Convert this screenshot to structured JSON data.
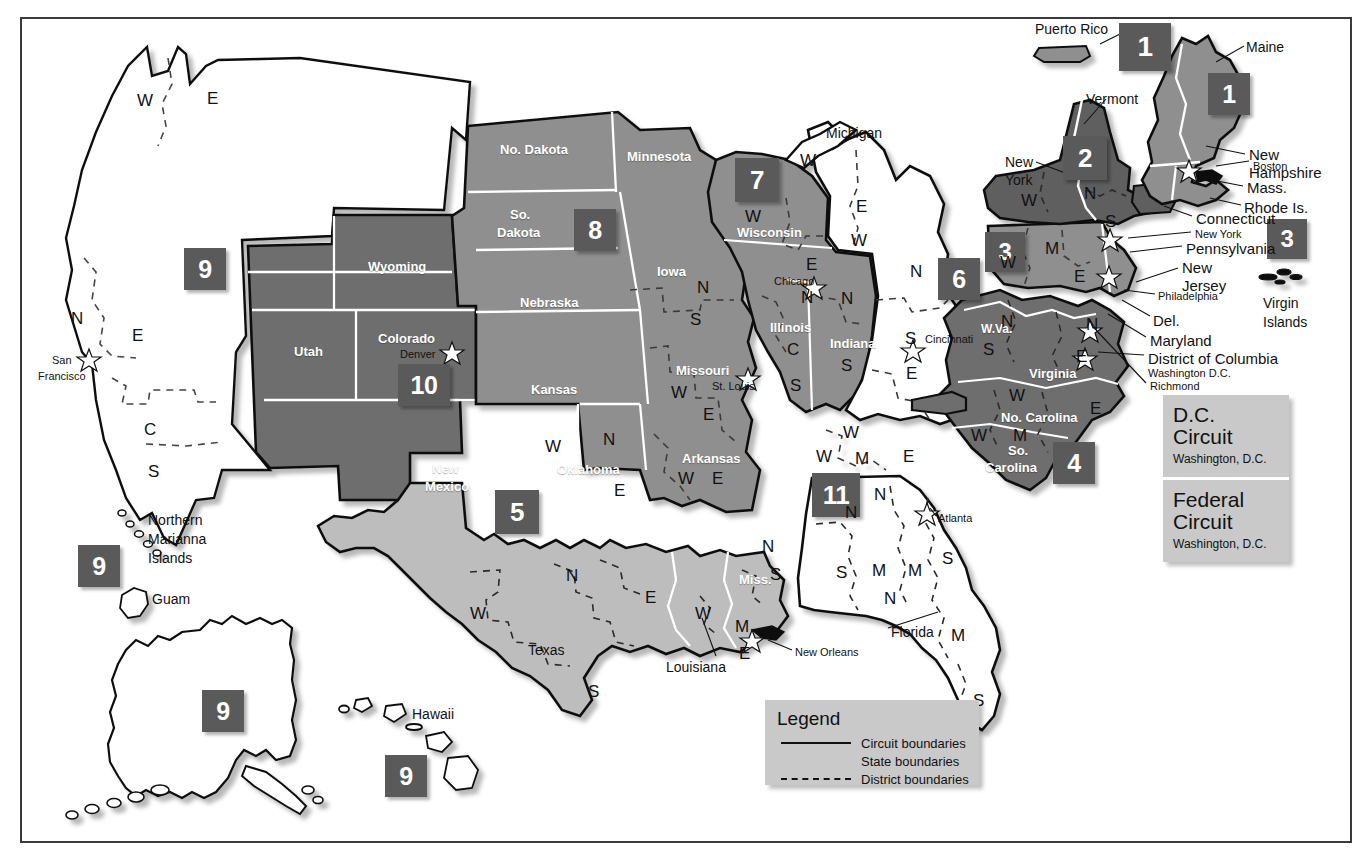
{
  "map": {
    "title": "Geographical Boundaries of United States Courts of Appeals and United States District Courts",
    "colors": {
      "badge_fill": "#5a5a5a",
      "badge_text": "#ffffff",
      "circuit_dark": "#6e6e6e",
      "circuit_mid": "#8f8f8f",
      "circuit_light": "#bdbdbd",
      "circuit_white": "#ffffff",
      "panel_fill": "#c9c9c9",
      "boundary": "#111111",
      "state_line": "#ffffff"
    }
  },
  "badges": [
    {
      "number": "1",
      "name": "badge-circuit-1-puerto-rico",
      "x": 1119,
      "y": 23,
      "w": 52,
      "h": 48,
      "fs": 28
    },
    {
      "number": "1",
      "name": "badge-circuit-1-maine",
      "x": 1208,
      "y": 73,
      "w": 42,
      "h": 42,
      "fs": 25
    },
    {
      "number": "2",
      "name": "badge-circuit-2",
      "x": 1063,
      "y": 136,
      "w": 44,
      "h": 44,
      "fs": 26
    },
    {
      "number": "3",
      "name": "badge-circuit-3",
      "x": 985,
      "y": 232,
      "w": 40,
      "h": 40,
      "fs": 24
    },
    {
      "number": "3",
      "name": "badge-circuit-3-virgin-islands",
      "x": 1267,
      "y": 219,
      "w": 40,
      "h": 40,
      "fs": 24
    },
    {
      "number": "4",
      "name": "badge-circuit-4",
      "x": 1053,
      "y": 442,
      "w": 42,
      "h": 42,
      "fs": 25
    },
    {
      "number": "5",
      "name": "badge-circuit-5",
      "x": 495,
      "y": 490,
      "w": 44,
      "h": 44,
      "fs": 26
    },
    {
      "number": "6",
      "name": "badge-circuit-6",
      "x": 938,
      "y": 258,
      "w": 42,
      "h": 42,
      "fs": 25
    },
    {
      "number": "7",
      "name": "badge-circuit-7",
      "x": 735,
      "y": 158,
      "w": 44,
      "h": 44,
      "fs": 26
    },
    {
      "number": "8",
      "name": "badge-circuit-8",
      "x": 574,
      "y": 209,
      "w": 42,
      "h": 42,
      "fs": 25
    },
    {
      "number": "9",
      "name": "badge-circuit-9-california",
      "x": 184,
      "y": 248,
      "w": 42,
      "h": 42,
      "fs": 25
    },
    {
      "number": "9",
      "name": "badge-circuit-9-marianas",
      "x": 78,
      "y": 545,
      "w": 42,
      "h": 42,
      "fs": 25
    },
    {
      "number": "9",
      "name": "badge-circuit-9-alaska",
      "x": 202,
      "y": 690,
      "w": 42,
      "h": 42,
      "fs": 25
    },
    {
      "number": "9",
      "name": "badge-circuit-9-hawaii",
      "x": 385,
      "y": 755,
      "w": 42,
      "h": 42,
      "fs": 25
    },
    {
      "number": "10",
      "name": "badge-circuit-10",
      "x": 398,
      "y": 364,
      "w": 52,
      "h": 42,
      "fs": 25
    },
    {
      "number": "11",
      "name": "badge-circuit-11",
      "x": 812,
      "y": 473,
      "w": 48,
      "h": 44,
      "fs": 26
    }
  ],
  "panels": [
    {
      "title_line1": "D.C.",
      "title_line2": "Circuit",
      "sub": "Washington, D.C."
    },
    {
      "title_line1": "Federal",
      "title_line2": "Circuit",
      "sub": "Washington, D.C."
    }
  ],
  "legend": {
    "title": "Legend",
    "rows": [
      {
        "key": "solid",
        "label": "Circuit boundaries"
      },
      {
        "key": "state",
        "label": "State boundaries"
      },
      {
        "key": "dashed",
        "label": "District boundaries"
      }
    ]
  },
  "state_labels_light": [
    {
      "text": "No. Dakota",
      "x": 500,
      "y": 143,
      "size": 13
    },
    {
      "text": "Minnesota",
      "x": 627,
      "y": 150,
      "size": 13
    },
    {
      "text": "So.",
      "x": 510,
      "y": 208,
      "size": 13
    },
    {
      "text": "Dakota",
      "x": 497,
      "y": 226,
      "size": 13
    },
    {
      "text": "Nebraska",
      "x": 520,
      "y": 296,
      "size": 13
    },
    {
      "text": "Iowa",
      "x": 657,
      "y": 265,
      "size": 13
    },
    {
      "text": "Kansas",
      "x": 531,
      "y": 383,
      "size": 13
    },
    {
      "text": "Oklahoma",
      "x": 557,
      "y": 463,
      "size": 13
    },
    {
      "text": "Missouri",
      "x": 676,
      "y": 364,
      "size": 13
    },
    {
      "text": "Arkansas",
      "x": 682,
      "y": 452,
      "size": 13
    },
    {
      "text": "Wyoming",
      "x": 368,
      "y": 260,
      "size": 13
    },
    {
      "text": "Utah",
      "x": 294,
      "y": 345,
      "size": 13
    },
    {
      "text": "Colorado",
      "x": 378,
      "y": 332,
      "size": 13
    },
    {
      "text": "New",
      "x": 432,
      "y": 462,
      "size": 13
    },
    {
      "text": "Mexico",
      "x": 425,
      "y": 480,
      "size": 13
    },
    {
      "text": "Wisconsin",
      "x": 737,
      "y": 226,
      "size": 13
    },
    {
      "text": "Illinois",
      "x": 770,
      "y": 321,
      "size": 13
    },
    {
      "text": "Indiana",
      "x": 830,
      "y": 337,
      "size": 13
    },
    {
      "text": "W.Va.",
      "x": 981,
      "y": 323,
      "size": 12
    },
    {
      "text": "Virginia",
      "x": 1029,
      "y": 367,
      "size": 13
    },
    {
      "text": "No. Carolina",
      "x": 1001,
      "y": 411,
      "size": 13
    },
    {
      "text": "So.",
      "x": 1008,
      "y": 444,
      "size": 13
    },
    {
      "text": "Carolina",
      "x": 985,
      "y": 461,
      "size": 13
    },
    {
      "text": "Miss.",
      "x": 739,
      "y": 573,
      "size": 13
    }
  ],
  "state_labels_dark": [
    {
      "text": "Michigan",
      "x": 826,
      "y": 126,
      "size": 14
    },
    {
      "text": "Texas",
      "x": 528,
      "y": 643,
      "size": 14
    },
    {
      "text": "Louisiana",
      "x": 666,
      "y": 660,
      "size": 14
    },
    {
      "text": "Florida",
      "x": 891,
      "y": 625,
      "size": 14
    },
    {
      "text": "Hawaii",
      "x": 412,
      "y": 707,
      "size": 14
    },
    {
      "text": "Guam",
      "x": 152,
      "y": 592,
      "size": 14
    },
    {
      "text": "Puerto Rico",
      "x": 1035,
      "y": 22,
      "size": 14
    },
    {
      "text": "Maine",
      "x": 1246,
      "y": 40,
      "size": 14
    },
    {
      "text": "Vermont",
      "x": 1086,
      "y": 92,
      "size": 14
    },
    {
      "text": "New",
      "x": 1005,
      "y": 155,
      "size": 14
    },
    {
      "text": "York",
      "x": 1005,
      "y": 173,
      "size": 14
    }
  ],
  "multiline_labels": [
    {
      "lines": [
        "Northern",
        "Marianna",
        "Islands"
      ],
      "x": 148,
      "y": 513,
      "size": 14
    },
    {
      "lines": [
        "Virgin",
        "Islands"
      ],
      "x": 1263,
      "y": 296,
      "size": 14
    }
  ],
  "callouts": [
    {
      "text": "New",
      "x": 1249,
      "y": 147,
      "size": 15
    },
    {
      "text": "Hampshire",
      "x": 1249,
      "y": 165,
      "size": 15
    },
    {
      "text": "Boston",
      "x": 1253,
      "y": 161,
      "size": 11
    },
    {
      "text": "Mass.",
      "x": 1247,
      "y": 180,
      "size": 15
    },
    {
      "text": "Rhode Is.",
      "x": 1244,
      "y": 200,
      "size": 15
    },
    {
      "text": "Connecticut",
      "x": 1196,
      "y": 211,
      "size": 15
    },
    {
      "text": "New York",
      "x": 1195,
      "y": 229,
      "size": 11
    },
    {
      "text": "Pennsylvania",
      "x": 1186,
      "y": 241,
      "size": 15
    },
    {
      "text": "New",
      "x": 1182,
      "y": 260,
      "size": 15
    },
    {
      "text": "Jersey",
      "x": 1182,
      "y": 278,
      "size": 15
    },
    {
      "text": "Philadelphia",
      "x": 1158,
      "y": 291,
      "size": 11
    },
    {
      "text": "Del.",
      "x": 1153,
      "y": 313,
      "size": 15
    },
    {
      "text": "Maryland",
      "x": 1150,
      "y": 333,
      "size": 15
    },
    {
      "text": "District of Columbia",
      "x": 1148,
      "y": 351,
      "size": 15
    },
    {
      "text": "Washington D.C.",
      "x": 1148,
      "y": 368,
      "size": 11
    },
    {
      "text": "Richmond",
      "x": 1150,
      "y": 381,
      "size": 11
    },
    {
      "text": "San",
      "x": 52,
      "y": 355,
      "size": 11
    },
    {
      "text": "Francisco",
      "x": 38,
      "y": 371,
      "size": 11
    },
    {
      "text": "Chicago",
      "x": 774,
      "y": 276,
      "size": 11
    },
    {
      "text": "St. Louis",
      "x": 712,
      "y": 381,
      "size": 11
    },
    {
      "text": "Cincinnati",
      "x": 925,
      "y": 334,
      "size": 11
    },
    {
      "text": "Denver",
      "x": 400,
      "y": 349,
      "size": 11
    },
    {
      "text": "Atlanta",
      "x": 938,
      "y": 513,
      "size": 11
    },
    {
      "text": "New Orleans",
      "x": 795,
      "y": 647,
      "size": 11
    }
  ],
  "district_letters": [
    {
      "text": "W",
      "x": 137,
      "y": 92
    },
    {
      "text": "E",
      "x": 207,
      "y": 90
    },
    {
      "text": "N",
      "x": 71,
      "y": 310
    },
    {
      "text": "E",
      "x": 132,
      "y": 327
    },
    {
      "text": "C",
      "x": 144,
      "y": 421
    },
    {
      "text": "S",
      "x": 148,
      "y": 463
    },
    {
      "text": "W",
      "x": 745,
      "y": 208
    },
    {
      "text": "E",
      "x": 806,
      "y": 256
    },
    {
      "text": "N",
      "x": 801,
      "y": 289
    },
    {
      "text": "C",
      "x": 787,
      "y": 341
    },
    {
      "text": "S",
      "x": 790,
      "y": 377
    },
    {
      "text": "N",
      "x": 841,
      "y": 290
    },
    {
      "text": "S",
      "x": 841,
      "y": 357
    },
    {
      "text": "W",
      "x": 843,
      "y": 424
    },
    {
      "text": "W",
      "x": 816,
      "y": 448
    },
    {
      "text": "M",
      "x": 855,
      "y": 450
    },
    {
      "text": "E",
      "x": 903,
      "y": 448
    },
    {
      "text": "W",
      "x": 800,
      "y": 152
    },
    {
      "text": "E",
      "x": 856,
      "y": 198
    },
    {
      "text": "W",
      "x": 851,
      "y": 232
    },
    {
      "text": "N",
      "x": 910,
      "y": 263
    },
    {
      "text": "S",
      "x": 905,
      "y": 330
    },
    {
      "text": "E",
      "x": 906,
      "y": 365
    },
    {
      "text": "N",
      "x": 697,
      "y": 279
    },
    {
      "text": "S",
      "x": 690,
      "y": 311
    },
    {
      "text": "W",
      "x": 671,
      "y": 384
    },
    {
      "text": "E",
      "x": 703,
      "y": 406
    },
    {
      "text": "W",
      "x": 678,
      "y": 470
    },
    {
      "text": "E",
      "x": 712,
      "y": 470
    },
    {
      "text": "W",
      "x": 545,
      "y": 438
    },
    {
      "text": "N",
      "x": 603,
      "y": 431
    },
    {
      "text": "E",
      "x": 614,
      "y": 482
    },
    {
      "text": "N",
      "x": 566,
      "y": 567
    },
    {
      "text": "W",
      "x": 470,
      "y": 605
    },
    {
      "text": "E",
      "x": 645,
      "y": 589
    },
    {
      "text": "S",
      "x": 588,
      "y": 683
    },
    {
      "text": "W",
      "x": 695,
      "y": 605
    },
    {
      "text": "M",
      "x": 735,
      "y": 618
    },
    {
      "text": "E",
      "x": 739,
      "y": 645
    },
    {
      "text": "N",
      "x": 762,
      "y": 538
    },
    {
      "text": "S",
      "x": 770,
      "y": 566
    },
    {
      "text": "N",
      "x": 874,
      "y": 486
    },
    {
      "text": "N",
      "x": 845,
      "y": 504
    },
    {
      "text": "S",
      "x": 836,
      "y": 564
    },
    {
      "text": "M",
      "x": 872,
      "y": 562
    },
    {
      "text": "M",
      "x": 908,
      "y": 562
    },
    {
      "text": "S",
      "x": 942,
      "y": 550
    },
    {
      "text": "N",
      "x": 884,
      "y": 590
    },
    {
      "text": "M",
      "x": 951,
      "y": 627
    },
    {
      "text": "S",
      "x": 973,
      "y": 692
    },
    {
      "text": "N",
      "x": 1001,
      "y": 313
    },
    {
      "text": "S",
      "x": 983,
      "y": 341
    },
    {
      "text": "W",
      "x": 1009,
      "y": 387
    },
    {
      "text": "E",
      "x": 1090,
      "y": 400
    },
    {
      "text": "W",
      "x": 971,
      "y": 427
    },
    {
      "text": "M",
      "x": 1013,
      "y": 427
    },
    {
      "text": "N",
      "x": 1086,
      "y": 316
    },
    {
      "text": "E",
      "x": 1076,
      "y": 348
    },
    {
      "text": "W",
      "x": 1021,
      "y": 192
    },
    {
      "text": "N",
      "x": 1084,
      "y": 185
    },
    {
      "text": "S",
      "x": 1105,
      "y": 213
    },
    {
      "text": "M",
      "x": 1045,
      "y": 240
    },
    {
      "text": "W",
      "x": 1000,
      "y": 254
    },
    {
      "text": "E",
      "x": 1074,
      "y": 268
    }
  ]
}
